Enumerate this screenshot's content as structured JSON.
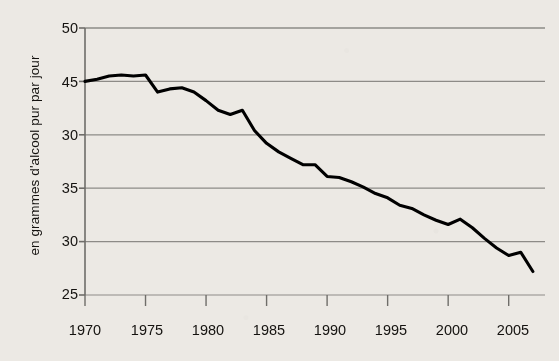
{
  "chart_data": {
    "type": "line",
    "title": "",
    "subtitle": "",
    "xlabel": "",
    "ylabel": "en grammes d'alcool pur par jour",
    "xlim": [
      1970,
      2008
    ],
    "ylim": [
      25,
      50
    ],
    "grid": true,
    "grid_axis": "y",
    "legend": false,
    "legend_position": "none",
    "line_color": "#000000",
    "grid_color": "#8d8b87",
    "axis_color": "#6f6d69",
    "background_color": "#ece9e4",
    "ytick_labels": [
      "50",
      "45",
      "30",
      "35",
      "30",
      "25"
    ],
    "ytick_values": [
      50,
      45,
      40,
      35,
      30,
      25
    ],
    "ytick_note": "Third label from top is printed as '30' in the source scan although the evenly-spaced gridline position corresponds to 40.",
    "xtick_labels": [
      "1970",
      "1975",
      "1980",
      "1985",
      "1990",
      "1995",
      "2000",
      "2005"
    ],
    "xtick_values": [
      1970,
      1975,
      1980,
      1985,
      1990,
      1995,
      2000,
      2005
    ],
    "series": [
      {
        "name": "consommation d'alcool pur par jour",
        "x": [
          1970,
          1971,
          1972,
          1973,
          1974,
          1975,
          1976,
          1977,
          1978,
          1979,
          1980,
          1981,
          1982,
          1983,
          1984,
          1985,
          1986,
          1987,
          1988,
          1989,
          1990,
          1991,
          1992,
          1993,
          1994,
          1995,
          1996,
          1997,
          1998,
          1999,
          2000,
          2001,
          2002,
          2003,
          2004,
          2005,
          2006,
          2007
        ],
        "values": [
          45.0,
          45.2,
          45.5,
          45.6,
          45.5,
          45.6,
          44.0,
          44.3,
          44.4,
          44.0,
          43.2,
          42.3,
          41.9,
          42.3,
          40.4,
          39.2,
          38.4,
          37.8,
          37.2,
          37.2,
          36.1,
          36.0,
          35.6,
          35.1,
          34.5,
          34.1,
          33.4,
          33.1,
          32.5,
          32.0,
          31.6,
          32.1,
          31.3,
          30.3,
          29.4,
          28.7,
          29.0,
          27.2
        ]
      }
    ]
  },
  "axis": {
    "ylabel": "en grammes d'alcool pur par jour"
  }
}
